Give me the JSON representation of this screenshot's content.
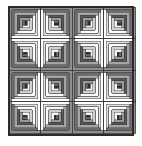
{
  "figure": {
    "title": "Log Cabin quilt pattern",
    "caption": "",
    "width": 142,
    "height": 146,
    "background_color": "#fdfdfb"
  },
  "frame": {
    "x": 8,
    "y": 6,
    "width": 126,
    "height": 130,
    "border_width": 1.6,
    "border_color": "#2b2b2b",
    "sashing_color": "#f2f0ec"
  },
  "grid": {
    "rows": 4,
    "columns": 4,
    "block_size": 31.5,
    "gap": 0.0,
    "origin_x": 9,
    "origin_y": 7
  },
  "palette": {
    "center": "#2e2e2e",
    "center_light": "#6e6e6e",
    "dark_strips": [
      "#8f8f8f",
      "#6b6b6b",
      "#a5a5a5",
      "#585858",
      "#9a9a9a"
    ],
    "light_strips": [
      "#ffffff",
      "#e3e1dd",
      "#fbfbf9",
      "#d2d0cb",
      "#f6f5f2"
    ],
    "outline": "#3a3a3a",
    "outline_width": 0.45
  },
  "block": {
    "ring_count": 5,
    "ring_width": 2.7,
    "center_size": 4.2,
    "description": "Concentric square logs, half light half dark, rotated per position"
  },
  "layout": {
    "orientations": [
      [
        180,
        270,
        180,
        270
      ],
      [
        90,
        0,
        90,
        0
      ],
      [
        180,
        270,
        180,
        270
      ],
      [
        90,
        0,
        90,
        0
      ]
    ],
    "orientation_labels": [
      [
        "dark-top-left",
        "dark-top-right",
        "dark-top-left",
        "dark-top-right"
      ],
      [
        "dark-bottom-left",
        "dark-bottom-right",
        "dark-bottom-left",
        "dark-bottom-right"
      ],
      [
        "dark-top-left",
        "dark-top-right",
        "dark-top-left",
        "dark-top-right"
      ],
      [
        "dark-bottom-left",
        "dark-bottom-right",
        "dark-bottom-left",
        "dark-bottom-right"
      ]
    ]
  }
}
